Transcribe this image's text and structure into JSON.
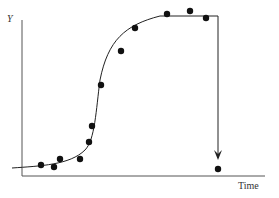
{
  "chart_data": {
    "type": "scatter",
    "title": "",
    "xlabel": "Time",
    "ylabel": "Y",
    "points": [
      {
        "x": 41,
        "y": 165
      },
      {
        "x": 54,
        "y": 167
      },
      {
        "x": 60,
        "y": 159
      },
      {
        "x": 80,
        "y": 159
      },
      {
        "x": 89,
        "y": 142
      },
      {
        "x": 92,
        "y": 126
      },
      {
        "x": 101,
        "y": 85
      },
      {
        "x": 121,
        "y": 51
      },
      {
        "x": 135,
        "y": 28
      },
      {
        "x": 167,
        "y": 14
      },
      {
        "x": 190,
        "y": 11
      },
      {
        "x": 206,
        "y": 18
      },
      {
        "x": 218,
        "y": 169
      }
    ],
    "curve": "M12,168 C40,166 70,165 85,150 C95,140 96,110 100,80 C108,40 125,25 160,16 L218,16",
    "drop_arrow": {
      "x": 218,
      "from_y": 16,
      "to_y": 160
    },
    "grid": false,
    "legend": null
  },
  "labels": {
    "y": "Y",
    "x": "Time"
  }
}
